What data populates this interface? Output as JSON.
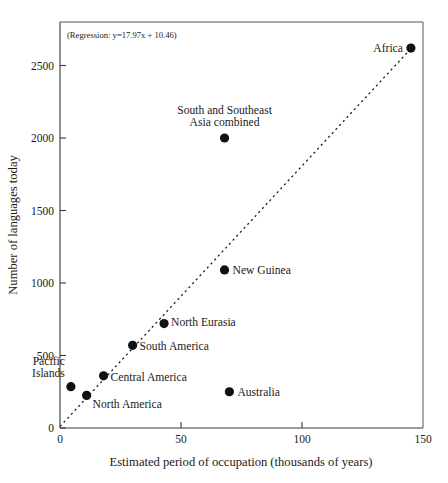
{
  "chart_data": {
    "type": "scatter",
    "title": "",
    "xlabel": "Estimated period of occupation (thousands of years)",
    "ylabel": "Number of languages today",
    "xlim": [
      0,
      150
    ],
    "ylim": [
      0,
      2800
    ],
    "xticks": [
      0,
      50,
      100,
      150
    ],
    "xtick_labels": [
      "0",
      "50",
      "100",
      "150"
    ],
    "yticks": [
      0,
      500,
      1000,
      1500,
      2000,
      2500
    ],
    "ytick_labels": [
      "0",
      "500",
      "1000",
      "1500",
      "2000",
      "2500"
    ],
    "grid": false,
    "legend": "none",
    "annotation": "(Regression: y=17.97x + 10.46)",
    "regression": {
      "slope": 17.97,
      "intercept": 10.46,
      "style": "dashed",
      "x_start": 0,
      "x_end": 145
    },
    "points": [
      {
        "label": "Pacific Islands",
        "x": 4.5,
        "y": 285,
        "label_dx": -6,
        "label_dy": -10,
        "anchor": "end",
        "multiline": [
          "Pacific",
          "Islands"
        ]
      },
      {
        "label": "North America",
        "x": 11,
        "y": 225,
        "label_dx": 6,
        "label_dy": 13,
        "anchor": "start",
        "multiline": [
          "North America"
        ]
      },
      {
        "label": "Central America",
        "x": 18,
        "y": 360,
        "label_dx": 7,
        "label_dy": 5,
        "anchor": "start",
        "multiline": [
          "Central America"
        ]
      },
      {
        "label": "South America",
        "x": 30,
        "y": 570,
        "label_dx": 7,
        "label_dy": 5,
        "anchor": "start",
        "multiline": [
          "South America"
        ]
      },
      {
        "label": "North Eurasia",
        "x": 43,
        "y": 720,
        "label_dx": 7,
        "label_dy": 2,
        "anchor": "start",
        "multiline": [
          "North Eurasia"
        ]
      },
      {
        "label": "New Guinea",
        "x": 68,
        "y": 1090,
        "label_dx": 8,
        "label_dy": 4,
        "anchor": "start",
        "multiline": [
          "New Guinea"
        ]
      },
      {
        "label": "Australia",
        "x": 70,
        "y": 250,
        "label_dx": 8,
        "label_dy": 4,
        "anchor": "start",
        "multiline": [
          "Australia"
        ]
      },
      {
        "label": "South and Southeast Asia combined",
        "x": 68,
        "y": 2000,
        "label_dx": 0,
        "label_dy": -12,
        "anchor": "middle",
        "multiline": [
          "South and Southeast",
          "Asia combined"
        ]
      },
      {
        "label": "Africa",
        "x": 145,
        "y": 2620,
        "label_dx": -8,
        "label_dy": 4,
        "anchor": "end",
        "multiline": [
          "Africa"
        ]
      }
    ]
  },
  "figure": {
    "caption": ""
  }
}
